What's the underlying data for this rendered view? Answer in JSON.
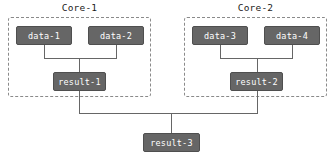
{
  "diagram": {
    "type": "flow-dependency-graph",
    "background_color": "#ffffff",
    "node_fill_color": "#666666",
    "node_text_color": "#ffffff",
    "group_border_color": "#8a8a8a",
    "edge_color": "#666666",
    "groups": [
      {
        "id": "core-1",
        "title": "Core-1",
        "x": 8,
        "y": 17,
        "width": 143,
        "height": 80
      },
      {
        "id": "core-2",
        "title": "Core-2",
        "x": 184,
        "y": 17,
        "width": 143,
        "height": 80
      }
    ],
    "nodes": [
      {
        "id": "data-1",
        "label": "data-1",
        "x": 16,
        "y": 26,
        "width": 56,
        "height": 19
      },
      {
        "id": "data-2",
        "label": "data-2",
        "x": 88,
        "y": 26,
        "width": 56,
        "height": 19
      },
      {
        "id": "data-3",
        "label": "data-3",
        "x": 192,
        "y": 26,
        "width": 56,
        "height": 19
      },
      {
        "id": "data-4",
        "label": "data-4",
        "x": 264,
        "y": 26,
        "width": 56,
        "height": 19
      },
      {
        "id": "result-1",
        "label": "result-1",
        "x": 53,
        "y": 72,
        "width": 53,
        "height": 19
      },
      {
        "id": "result-2",
        "label": "result-2",
        "x": 230,
        "y": 72,
        "width": 53,
        "height": 19
      },
      {
        "id": "result-3",
        "label": "result-3",
        "x": 143,
        "y": 133,
        "width": 57,
        "height": 19
      }
    ],
    "edges": [
      {
        "id": "data-1-to-result-1",
        "from": "data-1",
        "to": "result-1"
      },
      {
        "id": "data-2-to-result-1",
        "from": "data-2",
        "to": "result-1"
      },
      {
        "id": "data-3-to-result-2",
        "from": "data-3",
        "to": "result-2"
      },
      {
        "id": "data-4-to-result-2",
        "from": "data-4",
        "to": "result-2"
      },
      {
        "id": "result-1-to-result-3",
        "from": "result-1",
        "to": "result-3"
      },
      {
        "id": "result-2-to-result-3",
        "from": "result-2",
        "to": "result-3"
      }
    ]
  }
}
